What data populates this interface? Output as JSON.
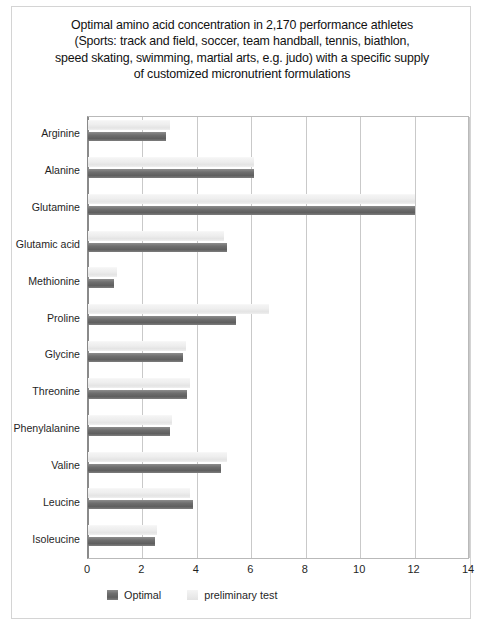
{
  "figure": {
    "title_lines": [
      "Optimal amino acid concentration in 2,170 performance athletes",
      "(Sports: track and field, soccer, team handball, tennis, biathlon,",
      "speed skating, swimming, martial arts, e.g. judo) with a specific supply",
      "of customized micronutrient formulations"
    ],
    "colors": {
      "optimal": "#6e6e6e",
      "preliminary": "#ececec",
      "grid": "#c9c9c9",
      "axis": "#8a8a8a",
      "frame": "#d4d4d4"
    }
  },
  "chart_data": {
    "type": "bar",
    "orientation": "horizontal",
    "xlabel": "",
    "ylabel": "",
    "xlim": [
      0,
      14
    ],
    "xticks": [
      0,
      2,
      4,
      6,
      8,
      10,
      12,
      14
    ],
    "xtick_labels": [
      "0",
      "2",
      "4",
      "6",
      "8",
      "10",
      "12",
      "14"
    ],
    "grid": true,
    "grid_axis": "x",
    "legend_position": "bottom-left",
    "categories": [
      "Arginine",
      "Alanine",
      "Glutamine",
      "Glutamic acid",
      "Methionine",
      "Proline",
      "Glycine",
      "Threonine",
      "Phenylalanine",
      "Valine",
      "Leucine",
      "Isoleucine"
    ],
    "series": [
      {
        "name": "preliminary test",
        "color": "#ececec",
        "values": [
          3.0,
          6.1,
          12.0,
          5.0,
          1.05,
          6.65,
          3.6,
          3.75,
          3.1,
          5.1,
          3.75,
          2.55
        ]
      },
      {
        "name": "Optimal",
        "color": "#6e6e6e",
        "values": [
          2.85,
          6.1,
          12.0,
          5.1,
          0.95,
          5.45,
          3.5,
          3.65,
          3.0,
          4.9,
          3.85,
          2.45
        ]
      }
    ]
  },
  "legend": {
    "items": [
      {
        "label": "Optimal",
        "swatch": "dark"
      },
      {
        "label": "preliminary test",
        "swatch": "light"
      }
    ]
  }
}
